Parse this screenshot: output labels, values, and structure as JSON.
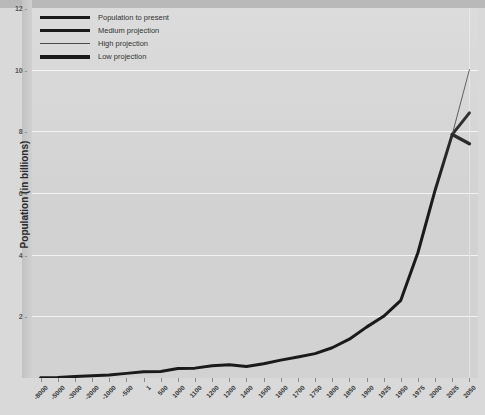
{
  "chart_data": {
    "type": "line",
    "title": "",
    "xlabel": "",
    "ylabel": "Population (in billions)",
    "ylim": [
      0,
      12
    ],
    "yticks": [
      2,
      4,
      6,
      8,
      10,
      12
    ],
    "grid": true,
    "legend_position": "top-left",
    "categories": [
      "-8000",
      "-5000",
      "-3000",
      "-2000",
      "-1000",
      "-500",
      "1",
      "500",
      "1000",
      "1100",
      "1200",
      "1300",
      "1400",
      "1500",
      "1600",
      "1700",
      "1750",
      "1800",
      "1850",
      "1900",
      "1925",
      "1950",
      "1975",
      "2000",
      "2025",
      "2050"
    ],
    "series": [
      {
        "name": "Population to present",
        "color": "#1a1a1a",
        "x": [
          "-8000",
          "-5000",
          "-3000",
          "-2000",
          "-1000",
          "-500",
          "1",
          "500",
          "1000",
          "1100",
          "1200",
          "1300",
          "1400",
          "1500",
          "1600",
          "1700",
          "1750",
          "1800",
          "1850",
          "1900",
          "1925",
          "1950",
          "1975",
          "2000",
          "2025"
        ],
        "values": [
          0.005,
          0.02,
          0.05,
          0.07,
          0.1,
          0.15,
          0.2,
          0.21,
          0.31,
          0.32,
          0.4,
          0.43,
          0.37,
          0.46,
          0.58,
          0.68,
          0.79,
          0.98,
          1.26,
          1.65,
          2.0,
          2.52,
          4.07,
          6.09,
          7.9
        ]
      },
      {
        "name": "Medium projection",
        "color": "#1a1a1a",
        "x": [
          "2025",
          "2050"
        ],
        "values": [
          7.9,
          8.6
        ]
      },
      {
        "name": "High projection",
        "color": "#4a4a4a",
        "x": [
          "2025",
          "2050"
        ],
        "values": [
          7.9,
          10.0
        ]
      },
      {
        "name": "Low projection",
        "color": "#1a1a1a",
        "x": [
          "2025",
          "2050"
        ],
        "values": [
          7.9,
          7.6
        ]
      }
    ]
  },
  "legend": {
    "items": [
      {
        "label": "Population to present",
        "style": "thick"
      },
      {
        "label": "Medium projection",
        "style": "med"
      },
      {
        "label": "High projection",
        "style": "thin"
      },
      {
        "label": "Low projection",
        "style": "low"
      }
    ]
  },
  "axis": {
    "y_title": "Population (in billions)"
  },
  "colors": {
    "plot_background": "#d2d2d2",
    "page_background": "#d9d9d9",
    "gridline": "#f2f2f2",
    "line": "#1a1a1a"
  }
}
